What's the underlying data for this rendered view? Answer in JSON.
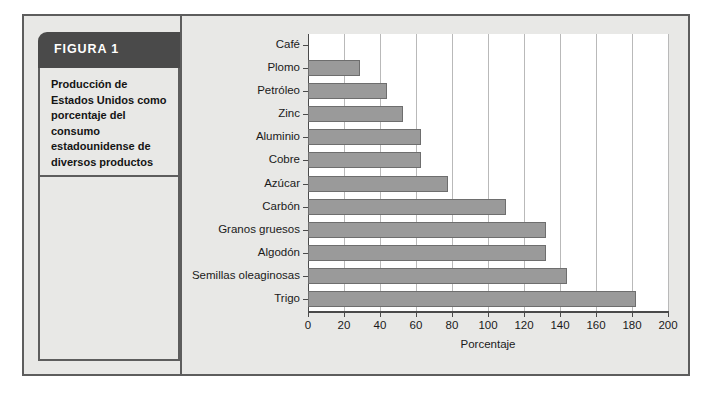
{
  "figure": {
    "header_label": "FIGURA 1",
    "caption": "Producción de Estados Unidos como porcentaje del consumo estadounidense de diversos productos",
    "header_bg": "#4a4a4a",
    "frame_border": "#5d5d5d",
    "panel_bg": "#e8e8e6"
  },
  "chart_data": {
    "type": "bar",
    "orientation": "horizontal",
    "title": "",
    "xlabel": "Porcentaje",
    "ylabel": "",
    "xlim": [
      0,
      200
    ],
    "xticks": [
      0,
      20,
      40,
      60,
      80,
      100,
      120,
      140,
      160,
      180,
      200
    ],
    "grid": true,
    "grid_axis": "x",
    "legend": false,
    "bar_color": "#9a9a9a",
    "bar_edge_color": "#6e6e6e",
    "plot_bg": "#ffffff",
    "categories": [
      "Café",
      "Plomo",
      "Petróleo",
      "Zinc",
      "Aluminio",
      "Cobre",
      "Azúcar",
      "Carbón",
      "Granos gruesos",
      "Algodón",
      "Semillas oleaginosas",
      "Trigo"
    ],
    "values": [
      0,
      29,
      44,
      53,
      63,
      63,
      78,
      110,
      132,
      132,
      144,
      182
    ]
  }
}
